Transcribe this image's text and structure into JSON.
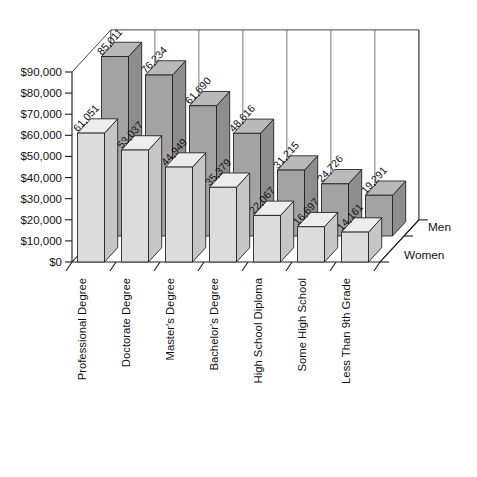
{
  "chart_data": {
    "type": "bar",
    "title": "",
    "xlabel": "",
    "ylabel": "",
    "ylim": [
      0,
      90000
    ],
    "grid": true,
    "legend_position": "right-depth-axis",
    "projection": "3d-grouped-bars",
    "categories": [
      "Professional Degree",
      "Doctorate Degree",
      "Master's Degree",
      "Bachelor's Degree",
      "High School Diploma",
      "Some High School",
      "Less Than 9th Grade"
    ],
    "ytick_labels": [
      "$0",
      "$10,000",
      "$20,000",
      "$30,000",
      "$40,000",
      "$50,000",
      "$60,000",
      "$70,000",
      "$80,000",
      "$90,000"
    ],
    "ytick_values": [
      0,
      10000,
      20000,
      30000,
      40000,
      50000,
      60000,
      70000,
      80000,
      90000
    ],
    "series": [
      {
        "name": "Men",
        "row": "back",
        "color": "#a3a3a3",
        "values": [
          85011,
          76234,
          61690,
          48616,
          31215,
          24726,
          19291
        ],
        "labels": [
          "85,011",
          "76,234",
          "61,690",
          "48,616",
          "31,215",
          "24,726",
          "19,291"
        ]
      },
      {
        "name": "Women",
        "row": "front",
        "color": "#dcdcdc",
        "values": [
          61051,
          53037,
          44949,
          35379,
          22067,
          16697,
          14161
        ],
        "labels": [
          "61,051",
          "53,037",
          "44,949",
          "35,379",
          "22,067",
          "16,697",
          "14,161"
        ]
      }
    ]
  },
  "legend": {
    "men_label": "Men",
    "women_label": "Women"
  },
  "colors": {
    "men_front": "#a3a3a3",
    "men_top": "#b9b9b9",
    "men_side": "#8d8d8d",
    "women_front": "#dcdcdc",
    "women_top": "#ededed",
    "women_side": "#c6c6c6",
    "axis": "#1e1e1e",
    "grid": "#555555",
    "background": "#ffffff"
  }
}
